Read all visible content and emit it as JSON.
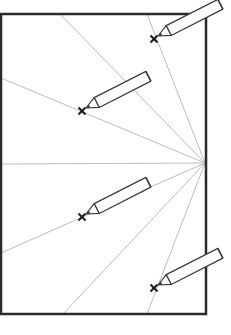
{
  "diagram": {
    "colors": {
      "background": "#ffffff",
      "frame": "#2a2a2a",
      "rays": "#bdbdbd",
      "pencil": "#3a3a3a",
      "mark": "#1a1a1a"
    },
    "sheet": {
      "x": 1,
      "y": 14,
      "width": 205,
      "height": 300
    },
    "focal_point": {
      "x": 205,
      "y": 163
    },
    "rays": [
      {
        "x": 60,
        "y": 14
      },
      {
        "x": 147,
        "y": 14
      },
      {
        "x": 1,
        "y": 78
      },
      {
        "x": 1,
        "y": 164
      },
      {
        "x": 1,
        "y": 253
      },
      {
        "x": 63,
        "y": 314
      },
      {
        "x": 147,
        "y": 314
      }
    ],
    "marks": [
      {
        "label": "x",
        "x": 154,
        "y": 39
      },
      {
        "label": "x",
        "x": 82,
        "y": 111
      },
      {
        "label": "x",
        "x": 82,
        "y": 217
      },
      {
        "label": "x",
        "x": 154,
        "y": 288
      }
    ],
    "pencil": {
      "angle": -27,
      "length": 70,
      "width": 11,
      "tip_length": 12
    }
  }
}
